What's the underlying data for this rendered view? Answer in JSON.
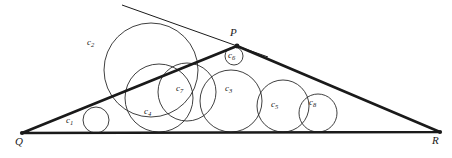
{
  "figure": {
    "kind": "geometry-diagram",
    "width": 452,
    "height": 158,
    "background_color": "#ffffff",
    "stroke_color": "#1a1a1a",
    "circle_stroke_color": "#2a2a2a",
    "triangle_stroke_width": 2.6,
    "circle_stroke_width": 0.9,
    "tangent_line_stroke_width": 1.0
  },
  "vertices": [
    {
      "name": "Q",
      "label": "Q",
      "x": 22,
      "y": 133,
      "label_x": 15,
      "label_y": 136
    },
    {
      "name": "P",
      "label": "P",
      "x": 237,
      "y": 46,
      "label_x": 230,
      "label_y": 27
    },
    {
      "name": "R",
      "label": "R",
      "x": 440,
      "y": 132,
      "label_x": 432,
      "label_y": 135
    }
  ],
  "triangle": {
    "name": "triangle-pqr",
    "points": "22,133 237,46 440,132",
    "base_label": "QR",
    "left_side_label": "QP",
    "right_side_label": "PR"
  },
  "tangent_line": {
    "name": "tangent-line-at-p",
    "x1": 122,
    "y1": 5,
    "x2": 268,
    "y2": 57
  },
  "circles": [
    {
      "id": "c1",
      "label": "c",
      "sub": "1",
      "cx": 96,
      "cy": 120,
      "r": 13,
      "label_x": 66,
      "label_y": 116
    },
    {
      "id": "c2",
      "label": "c",
      "sub": "2",
      "cx": 151,
      "cy": 70,
      "r": 47,
      "label_x": 87,
      "label_y": 38
    },
    {
      "id": "c3",
      "label": "c",
      "sub": "3",
      "cx": 231,
      "cy": 101,
      "r": 31,
      "label_x": 225,
      "label_y": 84
    },
    {
      "id": "c4",
      "label": "c",
      "sub": "4",
      "cx": 159,
      "cy": 98,
      "r": 34,
      "label_x": 144,
      "label_y": 107
    },
    {
      "id": "c5",
      "label": "c",
      "sub": "5",
      "cx": 283,
      "cy": 106,
      "r": 26,
      "label_x": 271,
      "label_y": 100
    },
    {
      "id": "c6",
      "label": "c",
      "sub": "6",
      "cx": 234,
      "cy": 56,
      "r": 9,
      "label_x": 228,
      "label_y": 51
    },
    {
      "id": "c7",
      "label": "c",
      "sub": "7",
      "cx": 187,
      "cy": 92,
      "r": 29,
      "label_x": 176,
      "label_y": 84
    },
    {
      "id": "c8",
      "label": "c",
      "sub": "8",
      "cx": 318,
      "cy": 113,
      "r": 19,
      "label_x": 309,
      "label_y": 98
    }
  ]
}
